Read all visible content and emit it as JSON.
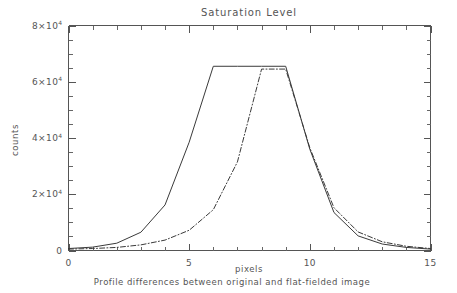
{
  "chart_data": {
    "type": "line",
    "title": "Saturation Level",
    "subtitle": "Profile differences between original and flat-fielded image",
    "xlabel": "pixels",
    "ylabel": "counts",
    "xlim": [
      0,
      15
    ],
    "ylim": [
      0,
      80000
    ],
    "grid": false,
    "legend": "none",
    "x_ticks": [
      {
        "value": 0,
        "label": "0"
      },
      {
        "value": 5,
        "label": "5"
      },
      {
        "value": 10,
        "label": "10"
      },
      {
        "value": 15,
        "label": "15"
      }
    ],
    "x_minor_step": 1,
    "y_ticks": [
      {
        "value": 0,
        "mantissa": "0",
        "base": "",
        "exponent": ""
      },
      {
        "value": 20000,
        "mantissa": "2",
        "base": "10",
        "exponent": "4"
      },
      {
        "value": 40000,
        "mantissa": "4",
        "base": "10",
        "exponent": "4"
      },
      {
        "value": 60000,
        "mantissa": "6",
        "base": "10",
        "exponent": "4"
      },
      {
        "value": 80000,
        "mantissa": "8",
        "base": "10",
        "exponent": "4"
      }
    ],
    "y_minor_step": 5000,
    "series": [
      {
        "name": "original image profile",
        "style": "solid",
        "color": "#3a3a3a",
        "x": [
          0,
          1,
          2,
          3,
          4,
          5,
          6,
          7,
          8,
          9,
          10,
          11,
          12,
          13,
          14,
          15
        ],
        "values": [
          700,
          1200,
          2600,
          6500,
          16200,
          38500,
          65500,
          65500,
          65500,
          65500,
          36000,
          13500,
          5200,
          2300,
          1100,
          500
        ]
      },
      {
        "name": "flat-fielded image profile",
        "style": "dash-dot",
        "color": "#3a3a3a",
        "x": [
          0,
          1,
          2,
          3,
          4,
          5,
          6,
          7,
          8,
          9,
          10,
          11,
          12,
          13,
          14,
          15
        ],
        "values": [
          500,
          700,
          1100,
          2000,
          3700,
          7200,
          14500,
          31500,
          64500,
          64500,
          36500,
          15200,
          6600,
          3100,
          1500,
          700
        ]
      }
    ]
  },
  "figure": {
    "background": "#ffffff",
    "axis_color": "#555555",
    "text_color": "#555555"
  }
}
